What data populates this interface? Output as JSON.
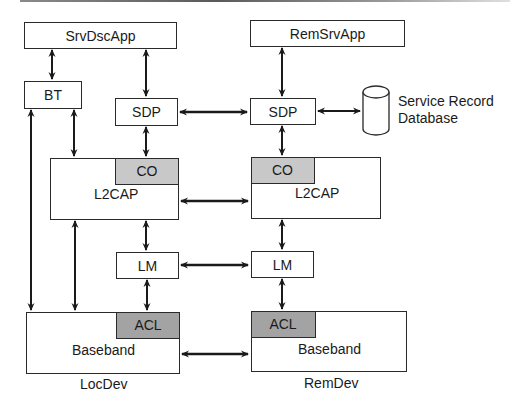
{
  "diagram": {
    "local": {
      "app": "SrvDscApp",
      "bt": "BT",
      "sdp": "SDP",
      "l2cap": "L2CAP",
      "co": "CO",
      "lm": "LM",
      "baseband": "Baseband",
      "acl": "ACL",
      "device_label": "LocDev"
    },
    "remote": {
      "app": "RemSrvApp",
      "sdp": "SDP",
      "l2cap": "L2CAP",
      "co": "CO",
      "lm": "LM",
      "baseband": "Baseband",
      "acl": "ACL",
      "device_label": "RemDev"
    },
    "database": {
      "line1": "Service Record",
      "line2": "Database"
    },
    "colors": {
      "co_fill": "#c8c8c8",
      "acl_fill": "#a3a3a3",
      "stroke": "#2a2a2a"
    }
  }
}
